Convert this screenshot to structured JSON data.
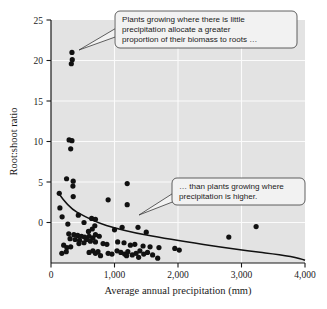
{
  "chart_data": {
    "type": "scatter",
    "title": "",
    "xlabel": "Average annual precipitation (mm)",
    "ylabel": "Root:shoot ratio",
    "xlim": [
      0,
      4000
    ],
    "ylim": [
      0,
      30
    ],
    "grid": true,
    "legend": "none",
    "xticks": [
      0,
      1000,
      2000,
      3000,
      4000
    ],
    "xtick_labels": [
      "0",
      "1,000",
      "2,000",
      "3,000",
      "4,000"
    ],
    "yticks": [
      0,
      5,
      10,
      15,
      20,
      25,
      30
    ],
    "ytick_labels": [
      "0",
      "5",
      "10",
      "15",
      "20",
      "25",
      "30"
    ],
    "ytick_labels_shown": [
      "5",
      "10",
      "15",
      "20",
      "25",
      "30"
    ],
    "points": [
      [
        330,
        26.0
      ],
      [
        335,
        25.1
      ],
      [
        320,
        24.6
      ],
      [
        285,
        15.2
      ],
      [
        330,
        15.1
      ],
      [
        310,
        14.1
      ],
      [
        245,
        10.4
      ],
      [
        350,
        10.1
      ],
      [
        345,
        9.5
      ],
      [
        1200,
        9.8
      ],
      [
        1200,
        7.2
      ],
      [
        900,
        7.8
      ],
      [
        130,
        8.6
      ],
      [
        350,
        8.2
      ],
      [
        140,
        6.8
      ],
      [
        175,
        5.7
      ],
      [
        430,
        5.9
      ],
      [
        640,
        5.5
      ],
      [
        700,
        5.4
      ],
      [
        520,
        5.0
      ],
      [
        265,
        4.8
      ],
      [
        690,
        4.6
      ],
      [
        1370,
        4.4
      ],
      [
        1120,
        4.4
      ],
      [
        3230,
        4.5
      ],
      [
        1000,
        4.1
      ],
      [
        1500,
        3.8
      ],
      [
        280,
        3.6
      ],
      [
        360,
        3.5
      ],
      [
        420,
        3.4
      ],
      [
        480,
        3.3
      ],
      [
        530,
        3.2
      ],
      [
        600,
        3.3
      ],
      [
        660,
        3.1
      ],
      [
        700,
        3.5
      ],
      [
        760,
        3.3
      ],
      [
        300,
        3.0
      ],
      [
        380,
        2.9
      ],
      [
        450,
        2.8
      ],
      [
        560,
        2.9
      ],
      [
        620,
        2.7
      ],
      [
        700,
        2.6
      ],
      [
        2800,
        3.2
      ],
      [
        820,
        2.4
      ],
      [
        880,
        2.3
      ],
      [
        1050,
        2.6
      ],
      [
        1150,
        2.5
      ],
      [
        1250,
        2.2
      ],
      [
        1320,
        2.3
      ],
      [
        1450,
        2.1
      ],
      [
        1560,
        2.0
      ],
      [
        1700,
        1.9
      ],
      [
        1950,
        1.8
      ],
      [
        2020,
        1.6
      ],
      [
        200,
        2.2
      ],
      [
        250,
        1.9
      ],
      [
        310,
        2.0
      ],
      [
        170,
        1.2
      ],
      [
        240,
        1.4
      ],
      [
        600,
        1.3
      ],
      [
        660,
        1.5
      ],
      [
        700,
        1.2
      ],
      [
        740,
        1.4
      ],
      [
        900,
        1.2
      ],
      [
        960,
        1.1
      ],
      [
        1040,
        1.5
      ],
      [
        1100,
        1.3
      ],
      [
        1160,
        1.1
      ],
      [
        1210,
        1.4
      ],
      [
        1280,
        1.0
      ],
      [
        1340,
        1.2
      ],
      [
        1400,
        1.5
      ],
      [
        1460,
        1.1
      ],
      [
        1520,
        1.3
      ],
      [
        1600,
        1.0
      ],
      [
        1680,
        0.6
      ],
      [
        1380,
        0.7
      ],
      [
        1190,
        0.9
      ],
      [
        780,
        0.9
      ],
      [
        520,
        2.5
      ],
      [
        440,
        2.4
      ],
      [
        590,
        3.9
      ],
      [
        650,
        4.2
      ]
    ],
    "trend_line": {
      "description": "declining power curve",
      "points": [
        [
          120,
          8.6
        ],
        [
          250,
          6.4
        ],
        [
          400,
          5.3
        ],
        [
          600,
          4.5
        ],
        [
          800,
          3.9
        ],
        [
          1000,
          3.5
        ],
        [
          1300,
          3.0
        ],
        [
          1600,
          2.6
        ],
        [
          2000,
          2.1
        ],
        [
          2500,
          1.5
        ],
        [
          3000,
          1.0
        ],
        [
          3500,
          0.6
        ],
        [
          4000,
          0.35
        ]
      ]
    },
    "annotations": [
      {
        "id": "callout-low-precipitation",
        "lines": [
          "Plants growing where there is little",
          "precipitation allocate a greater",
          "proportion of their biomass to roots …"
        ],
        "points_to": [
          330,
          26.0
        ]
      },
      {
        "id": "callout-high-precipitation",
        "lines": [
          "… than plants growing where",
          "precipitation is higher."
        ],
        "points_to": [
          1100,
          5.2
        ]
      }
    ]
  },
  "colors": {
    "plot_background": "#e3e3e3",
    "gridline": "#fbfbfb",
    "point": "#111111",
    "curve": "#111111",
    "callout_fill": "#f2f2f2",
    "callout_stroke": "#3a3a3a",
    "text": "#1a1a1a"
  }
}
